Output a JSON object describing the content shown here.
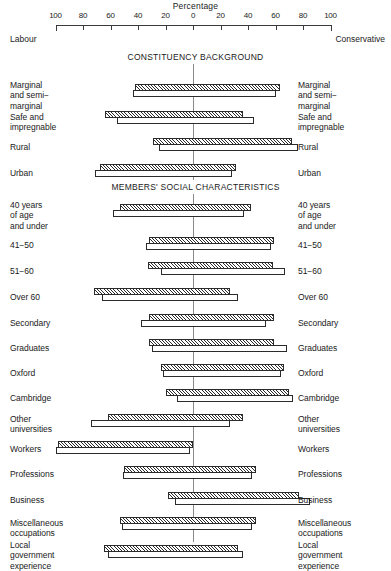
{
  "axis": {
    "title": "Percentage",
    "tick_labels": [
      "100",
      "80",
      "60",
      "40",
      "20",
      "0",
      "20",
      "40",
      "60",
      "80",
      "100"
    ],
    "tick_values": [
      -100,
      -80,
      -60,
      -40,
      -20,
      0,
      20,
      40,
      60,
      80,
      100
    ],
    "left_pole": "Labour",
    "right_pole": "Conservative"
  },
  "sections": [
    {
      "heading": "CONSTITUENCY BACKGROUND"
    },
    {
      "heading": "MEMBERS' SOCIAL CHARACTERISTICS"
    }
  ],
  "rows": [
    {
      "label": "Marginal\nand semi−\nmarginal",
      "labour": 42,
      "conservative": 63,
      "labour_white": 44,
      "conservative_white": 60
    },
    {
      "label": "Safe and\nimpregnable",
      "labour": 64,
      "conservative": 36,
      "labour_white": 55,
      "conservative_white": 44
    },
    {
      "label": "Rural",
      "labour": 29,
      "conservative": 72,
      "labour_white": 25,
      "conservative_white": 76
    },
    {
      "label": "Urban",
      "labour": 68,
      "conservative": 31,
      "labour_white": 71,
      "conservative_white": 28
    },
    {
      "label": "40 years\nof age\nand under",
      "labour": 53,
      "conservative": 42,
      "labour_white": 58,
      "conservative_white": 37
    },
    {
      "label": "41−50",
      "labour": 32,
      "conservative": 59,
      "labour_white": 34,
      "conservative_white": 57
    },
    {
      "label": "51−60",
      "labour": 33,
      "conservative": 58,
      "labour_white": 23,
      "conservative_white": 67
    },
    {
      "label": "Over 60",
      "labour": 72,
      "conservative": 27,
      "labour_white": 66,
      "conservative_white": 33
    },
    {
      "label": "Secondary",
      "labour": 32,
      "conservative": 59,
      "labour_white": 38,
      "conservative_white": 53
    },
    {
      "label": "Graduates",
      "labour": 32,
      "conservative": 59,
      "labour_white": 30,
      "conservative_white": 68
    },
    {
      "label": "Oxford",
      "labour": 23,
      "conservative": 66,
      "labour_white": 22,
      "conservative_white": 64
    },
    {
      "label": "Cambridge",
      "labour": 20,
      "conservative": 70,
      "labour_white": 12,
      "conservative_white": 73
    },
    {
      "label": "Other\nuniversities",
      "labour": 62,
      "conservative": 36,
      "labour_white": 74,
      "conservative_white": 27
    },
    {
      "label": "Workers",
      "labour": 98,
      "conservative": 0,
      "labour_white": 100,
      "conservative_white": -2
    },
    {
      "label": "Professions",
      "labour": 50,
      "conservative": 46,
      "labour_white": 51,
      "conservative_white": 43
    },
    {
      "label": "Business",
      "labour": 18,
      "conservative": 77,
      "labour_white": 13,
      "conservative_white": 85
    },
    {
      "label": "Miscellaneous\noccupations",
      "labour": 53,
      "conservative": 46,
      "labour_white": 52,
      "conservative_white": 43
    },
    {
      "label": "Local\ngovernment\nexperience",
      "labour": 65,
      "conservative": 33,
      "labour_white": 62,
      "conservative_white": 36
    }
  ],
  "chart_data": {
    "type": "bar",
    "title": "Percentage",
    "subtitle": "Paired horizontal diverging bars: Labour (left) vs Conservative (right)",
    "xlabel": "Percentage",
    "ylabel": "",
    "xlim": [
      -100,
      100
    ],
    "xticks": [
      -100,
      -80,
      -60,
      -40,
      -20,
      0,
      20,
      40,
      60,
      80,
      100
    ],
    "xticklabels": [
      "100",
      "80",
      "60",
      "40",
      "20",
      "0",
      "20",
      "40",
      "60",
      "80",
      "100"
    ],
    "grid": false,
    "legend": [
      "hatched bar (upper)",
      "open bar (lower)"
    ],
    "legend_position": "none",
    "annotations": [
      "Labour",
      "Conservative",
      "CONSTITUENCY BACKGROUND",
      "MEMBERS' SOCIAL CHARACTERISTICS"
    ],
    "categories": [
      "Marginal and semi-marginal",
      "Safe and impregnable",
      "Rural",
      "Urban",
      "40 years of age and under",
      "41-50",
      "51-60",
      "Over 60",
      "Secondary",
      "Graduates",
      "Oxford",
      "Cambridge",
      "Other universities",
      "Workers",
      "Professions",
      "Business",
      "Miscellaneous occupations",
      "Local government experience"
    ],
    "series": [
      {
        "name": "Labour (hatched, left extent %)",
        "values": [
          42,
          64,
          29,
          68,
          53,
          32,
          33,
          72,
          32,
          32,
          23,
          20,
          62,
          98,
          50,
          18,
          53,
          65
        ]
      },
      {
        "name": "Conservative (hatched, right extent %)",
        "values": [
          63,
          36,
          72,
          31,
          42,
          59,
          58,
          27,
          59,
          59,
          66,
          70,
          36,
          0,
          46,
          77,
          46,
          33
        ]
      },
      {
        "name": "Labour (open, left extent %)",
        "values": [
          44,
          55,
          25,
          71,
          58,
          34,
          23,
          66,
          38,
          30,
          22,
          12,
          74,
          100,
          51,
          13,
          52,
          62
        ]
      },
      {
        "name": "Conservative (open, right extent %)",
        "values": [
          60,
          44,
          76,
          28,
          37,
          57,
          67,
          33,
          53,
          68,
          64,
          73,
          27,
          -2,
          43,
          85,
          43,
          36
        ]
      }
    ]
  },
  "geometry": {
    "center_x": 193,
    "px_per_percent": 1.375,
    "axis_left_x": 55,
    "axis_right_x": 331,
    "axis_title_y": 1,
    "section_heading_y": [
      52,
      182
    ],
    "row_top_y": [
      84,
      111,
      138,
      164,
      204,
      237,
      262,
      288,
      314,
      339,
      364,
      389,
      414,
      441,
      466,
      492,
      517,
      545
    ],
    "row_label_y": [
      80,
      112,
      142,
      168,
      200,
      240,
      266,
      292,
      318,
      343,
      368,
      393,
      414,
      444,
      469,
      495,
      518,
      540
    ]
  }
}
